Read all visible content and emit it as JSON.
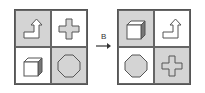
{
  "transform_label": "B",
  "left_grid": {
    "cells": [
      {
        "shape": "bent-arrow-icon",
        "shaded": true
      },
      {
        "shape": "cross-icon",
        "shaded": false
      },
      {
        "shape": "cube-icon",
        "shaded": false
      },
      {
        "shape": "octagon-icon",
        "shaded": true
      }
    ]
  },
  "right_grid": {
    "cells": [
      {
        "shape": "cube-icon",
        "shaded": true
      },
      {
        "shape": "bent-arrow-icon",
        "shaded": false
      },
      {
        "shape": "octagon-icon",
        "shaded": false
      },
      {
        "shape": "cross-icon",
        "shaded": true
      }
    ]
  },
  "colors": {
    "shade": "#d4d4d4",
    "stroke": "#555555",
    "shape_fill": "#d4d4d4"
  }
}
